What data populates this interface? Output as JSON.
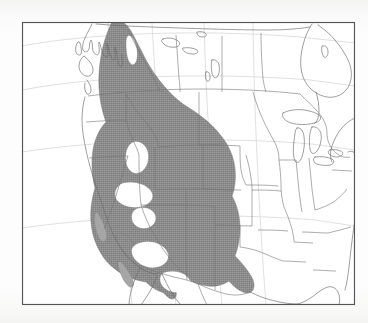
{
  "figure": {
    "type": "range-map",
    "title": "",
    "caption": "",
    "region": "North America",
    "projection": "conic",
    "frame": {
      "x": 22,
      "y": 22,
      "width": 333,
      "height": 283,
      "border_color": "#555555",
      "border_width": 1,
      "fill": "#ffffff"
    },
    "background_color": "#fbfbfa",
    "colors": {
      "range_fill": "#8c8c8c",
      "range_fill_light": "#a6a6a6",
      "coastline": "#6b6b6b",
      "political_border": "#757575",
      "graticule": "#d8d8d8",
      "frame": "#555555",
      "ocean": "#ffffff",
      "land": "#ffffff"
    }
  },
  "legend": {
    "visible": false,
    "entries": [
      {
        "label": "Distribution range",
        "swatch": "#8c8c8c",
        "pattern": "solid-gray"
      }
    ]
  },
  "labels": {
    "visible": false,
    "items": []
  },
  "layers": [
    {
      "name": "coastline",
      "visible": true,
      "stroke": "#6b6b6b"
    },
    {
      "name": "country-borders",
      "visible": true,
      "stroke": "#6b6b6b"
    },
    {
      "name": "state-province-borders",
      "visible": true,
      "stroke": "#757575"
    },
    {
      "name": "graticule",
      "visible": true,
      "stroke": "#d8d8d8"
    },
    {
      "name": "species-range",
      "visible": true,
      "fill": "#8c8c8c"
    }
  ],
  "range_description": {
    "extent_north": "central British Columbia / Yukon border",
    "extent_south": "northern Mexico (Sierra Madre Occidental)",
    "extent_west": "Pacific coast ranges, Oregon / Washington",
    "extent_east": "western Great Plains (eastern Colorado, western Kansas)",
    "gaps": [
      "northern Great Basin, Nevada",
      "southern Great Basin, Nevada",
      "Snake River Plain, Idaho"
    ]
  },
  "graticule_values": {
    "parallels": [
      30,
      40,
      50,
      60
    ],
    "meridians": [
      -120,
      -110,
      -100,
      -90,
      -80,
      -70
    ]
  }
}
